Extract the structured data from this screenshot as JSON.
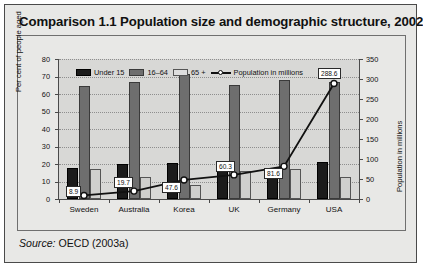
{
  "figure": {
    "title": "Comparison 1.1  Population size and demographic structure, 2002",
    "source_prefix": "Source:",
    "source_text": " OECD (2003a)"
  },
  "legend": {
    "items": [
      {
        "label": "Under 15",
        "swatch": "black",
        "color": "#1b1b1b"
      },
      {
        "label": "16–64",
        "swatch": "dark-gray",
        "color": "#6e6e6e"
      },
      {
        "label": "65 +",
        "swatch": "light-gray",
        "color": "#dedede"
      },
      {
        "label": "Population in millions",
        "swatch": "line-marker",
        "color": "#111111"
      }
    ]
  },
  "chart_data": {
    "type": "bar",
    "title": "Comparison 1.1  Population size and demographic structure, 2002",
    "categories": [
      "Sweden",
      "Australia",
      "Korea",
      "UK",
      "Germany",
      "USA"
    ],
    "series": [
      {
        "name": "Under 15",
        "axis": "left",
        "values": [
          18.0,
          20.2,
          20.6,
          18.6,
          15.2,
          21.2
        ]
      },
      {
        "name": "16–64",
        "axis": "left",
        "values": [
          64.8,
          67.0,
          71.4,
          65.2,
          68.2,
          66.6
        ]
      },
      {
        "name": "65 +",
        "axis": "left",
        "values": [
          17.2,
          12.6,
          7.8,
          15.8,
          17.0,
          12.4
        ]
      },
      {
        "name": "Population in millions",
        "axis": "right",
        "type": "line",
        "values": [
          8.9,
          19.7,
          47.6,
          60.3,
          81.6,
          288.6
        ],
        "labels": [
          "8.9",
          "19.7",
          "47.6",
          "60.3",
          "81.6",
          "288.6"
        ]
      }
    ],
    "xlabel": "",
    "ylabel": "Per cent of people aged",
    "y2label": "Population in millions",
    "ylim": [
      0,
      80
    ],
    "y2lim": [
      0,
      350
    ],
    "yticks": [
      0,
      10,
      20,
      30,
      40,
      50,
      60,
      70,
      80
    ],
    "y2ticks": [
      0,
      50,
      100,
      150,
      200,
      250,
      300,
      350
    ],
    "grid": true,
    "legend_position": "top"
  }
}
